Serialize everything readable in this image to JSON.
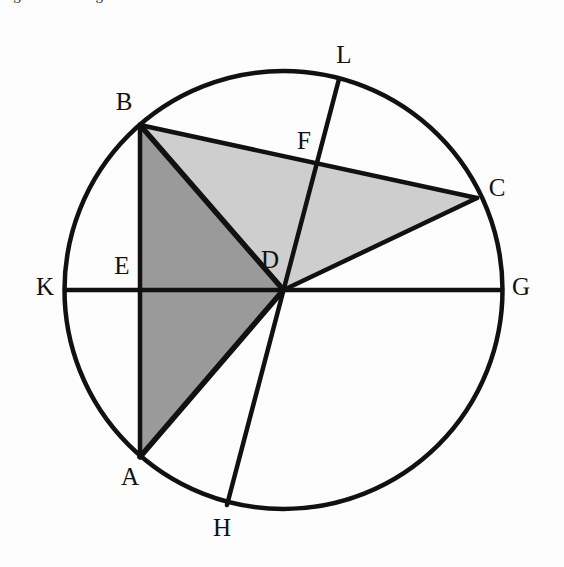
{
  "figure": {
    "title_clipped": "Figure 2.  Triangle areas in a circle",
    "colors": {
      "stroke": "#111111",
      "background": "#fdfdfd",
      "dark_shade": "#9a9a9a",
      "light_shade": "#cecece",
      "label": "#111111"
    },
    "circle": {
      "center_label": "D",
      "cx": 283.5,
      "cy": 290,
      "r": 219,
      "stroke_width": 4.5
    },
    "points": [
      {
        "id": "A",
        "label": "A",
        "x": 140,
        "y": 457,
        "on_circle": true,
        "label_x": 130,
        "label_y": 479
      },
      {
        "id": "B",
        "label": "B",
        "x": 140,
        "y": 125,
        "on_circle": true,
        "label_x": 124,
        "label_y": 104
      },
      {
        "id": "C",
        "label": "C",
        "x": 477,
        "y": 198,
        "on_circle": true,
        "label_x": 497,
        "label_y": 190
      },
      {
        "id": "D",
        "label": "D",
        "x": 283.5,
        "y": 290,
        "on_circle": false,
        "label_x": 270,
        "label_y": 262
      },
      {
        "id": "E",
        "label": "E",
        "x": 140,
        "y": 290,
        "on_circle": false,
        "label_x": 122,
        "label_y": 268
      },
      {
        "id": "F",
        "label": "F",
        "x": 318,
        "y": 163,
        "on_circle": false,
        "label_x": 304,
        "label_y": 143
      },
      {
        "id": "G",
        "label": "G",
        "x": 502,
        "y": 290,
        "on_circle": true,
        "label_x": 521,
        "label_y": 289
      },
      {
        "id": "H",
        "label": "H",
        "x": 227,
        "y": 505,
        "on_circle": true,
        "label_x": 222,
        "label_y": 530
      },
      {
        "id": "K",
        "label": "K",
        "x": 65,
        "y": 290,
        "on_circle": true,
        "label_x": 45,
        "label_y": 289
      },
      {
        "id": "L",
        "label": "L",
        "x": 339,
        "y": 79,
        "on_circle": true,
        "label_x": 344,
        "label_y": 57
      }
    ],
    "segments": [
      {
        "id": "K-G",
        "name": "diameter-kg",
        "from": "K",
        "to": "G",
        "width": 4.5
      },
      {
        "id": "L-H",
        "name": "chord-lh",
        "from": "L",
        "to": "H",
        "width": 4.5
      },
      {
        "id": "A-B",
        "name": "chord-ab",
        "from": "A",
        "to": "B",
        "width": 4.5
      },
      {
        "id": "B-C",
        "name": "chord-bc",
        "from": "B",
        "to": "C",
        "width": 4.5
      },
      {
        "id": "B-D",
        "name": "segment-bd",
        "from": "B",
        "to": "D",
        "width": 5.5
      },
      {
        "id": "A-D",
        "name": "segment-ad",
        "from": "A",
        "to": "D",
        "width": 5.5
      },
      {
        "id": "D-C",
        "name": "segment-dc",
        "from": "D",
        "to": "C",
        "width": 4.5
      }
    ],
    "shaded_regions": [
      {
        "id": "triangle-ABD",
        "name": "dark-shaded-triangle-abd",
        "shade": "dark",
        "vertices": [
          "B",
          "A",
          "D"
        ]
      },
      {
        "id": "triangle-BDC",
        "name": "light-shaded-triangle-bdc",
        "shade": "light",
        "vertices": [
          "B",
          "C",
          "D"
        ]
      }
    ]
  }
}
